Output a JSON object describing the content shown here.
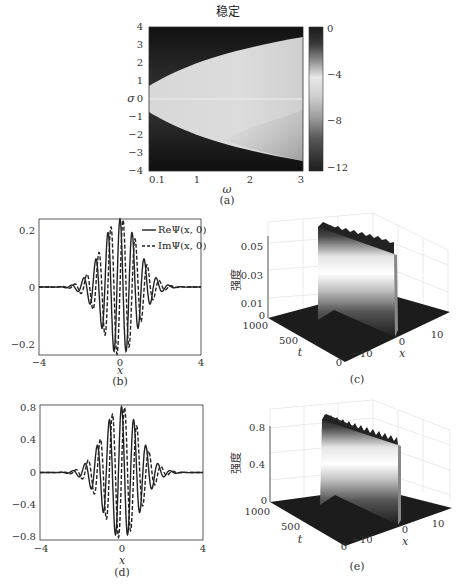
{
  "figure": {
    "panel_a": {
      "title": "稳定",
      "xlabel": "ω",
      "ylabel": "σ",
      "caption": "(a)",
      "xticks": [
        "0.1",
        "1",
        "2",
        "3"
      ],
      "yticks": [
        "4",
        "3",
        "2",
        "1",
        "0",
        "−1",
        "−2",
        "−3",
        "−4"
      ],
      "colorbar_ticks": [
        "0",
        "−4",
        "−8",
        "−12"
      ]
    },
    "panel_b": {
      "caption": "(b)",
      "xlabel": "x",
      "xticks": [
        "−4",
        "0",
        "4"
      ],
      "yticks": [
        "0.2",
        "0",
        "−0.2"
      ],
      "legend": [
        "ReΨ(x, 0)",
        "ImΨ(x, 0)"
      ]
    },
    "panel_c": {
      "caption": "(c)",
      "zlabel": "强度",
      "zticks": [
        "0.05",
        "0.03",
        "0.01",
        "0"
      ],
      "tticks": [
        "1000",
        "500",
        "0"
      ],
      "tlabel": "t",
      "xticks": [
        "−10",
        "0",
        "10"
      ],
      "xlabel": "x"
    },
    "panel_d": {
      "caption": "(d)",
      "xlabel": "x",
      "xticks": [
        "−4",
        "0",
        "4"
      ],
      "yticks": [
        "0.8",
        "0.4",
        "0",
        "−0.4",
        "−0.8"
      ]
    },
    "panel_e": {
      "caption": "(e)",
      "zlabel": "强度",
      "zticks": [
        "0.8",
        "0.4",
        "0"
      ],
      "tticks": [
        "1000",
        "500",
        "0"
      ],
      "tlabel": "t",
      "xticks": [
        "−10",
        "0",
        "10"
      ],
      "xlabel": "x"
    }
  },
  "chart_data": [
    {
      "type": "heatmap",
      "title": "稳定",
      "xlabel": "ω",
      "ylabel": "σ",
      "xlim": [
        0.1,
        3
      ],
      "ylim": [
        -4,
        4
      ],
      "xticks": [
        0.1,
        1,
        2,
        3
      ],
      "yticks": [
        4,
        3,
        2,
        1,
        0,
        -1,
        -2,
        -3,
        -4
      ],
      "colorbar": {
        "range": [
          -12,
          0
        ],
        "ticks": [
          0,
          -4,
          -8,
          -12
        ]
      },
      "description": "Stable (light) parabolic region opening toward larger ω; boundary σ ≈ ±0.7 at ω=0.1 widening to σ ≈ ±3.4 at ω=3; outside region dark.",
      "boundary": {
        "omega": [
          0.1,
          1,
          2,
          3
        ],
        "sigma_upper": [
          0.7,
          2.0,
          2.9,
          3.4
        ],
        "sigma_lower": [
          -0.7,
          -2.0,
          -2.9,
          -3.4
        ]
      }
    },
    {
      "type": "line",
      "xlabel": "x",
      "ylabel": "",
      "xlim": [
        -4,
        4
      ],
      "ylim": [
        -0.23,
        0.23
      ],
      "xticks": [
        -4,
        0,
        4
      ],
      "yticks": [
        -0.2,
        0,
        0.2
      ],
      "legend_position": "upper right",
      "series": [
        {
          "name": "ReΨ(x, 0)",
          "style": "solid",
          "envelope_peak": 0.23,
          "carrier_wavenumber": 10.5
        },
        {
          "name": "ImΨ(x, 0)",
          "style": "dashed",
          "envelope_peak": 0.23,
          "carrier_wavenumber": 10.5
        }
      ],
      "description": "Gaussian-modulated oscillating wave packet centered at x=0, decays to 0 beyond |x|≈3"
    },
    {
      "type": "area",
      "title": "3D intensity evolution",
      "zlabel": "强度",
      "zlim": [
        0,
        0.055
      ],
      "zticks": [
        0,
        0.01,
        0.03,
        0.05
      ],
      "tlim": [
        0,
        1000
      ],
      "tticks": [
        0,
        500,
        1000
      ],
      "xlim": [
        -15,
        15
      ],
      "xticks": [
        -10,
        0,
        10
      ],
      "description": "Stable localized ridge near x=0 with peak intensity ≈0.055 constant over t∈[0,1000]"
    },
    {
      "type": "line",
      "xlabel": "x",
      "xlim": [
        -4,
        4
      ],
      "ylim": [
        -0.85,
        0.85
      ],
      "xticks": [
        -4,
        0,
        4
      ],
      "yticks": [
        -0.8,
        -0.4,
        0,
        0.4,
        0.8
      ],
      "series": [
        {
          "name": "ReΨ(x, 0)",
          "style": "solid",
          "envelope_peak": 0.83,
          "carrier_wavenumber": 10.5
        },
        {
          "name": "ImΨ(x, 0)",
          "style": "dashed",
          "envelope_peak": 0.83,
          "carrier_wavenumber": 10.5
        }
      ],
      "description": "Gaussian-modulated oscillating wave packet centered at x=0 with amplitude ≈0.83"
    },
    {
      "type": "area",
      "title": "3D intensity evolution",
      "zlabel": "强度",
      "zlim": [
        0,
        0.85
      ],
      "zticks": [
        0,
        0.4,
        0.8
      ],
      "tlim": [
        0,
        1000
      ],
      "tticks": [
        0,
        500,
        1000
      ],
      "xlim": [
        -15,
        15
      ],
      "xticks": [
        -10,
        0,
        10
      ],
      "description": "Localized ridge near x=0 with peak intensity ≈0.8, slight oscillation along t"
    }
  ]
}
